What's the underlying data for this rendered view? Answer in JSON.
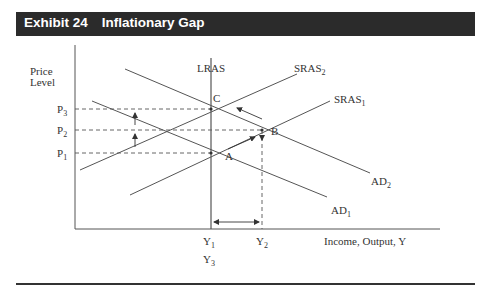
{
  "header": {
    "exhibit": "Exhibit 24",
    "title": "Inflationary Gap"
  },
  "axes": {
    "y_label_line1": "Price",
    "y_label_line2": "Level",
    "x_label": "Income, Output, Y"
  },
  "price_levels": [
    {
      "base": "P",
      "sub": "3"
    },
    {
      "base": "P",
      "sub": "2"
    },
    {
      "base": "P",
      "sub": "1"
    }
  ],
  "output_levels": [
    {
      "base": "Y",
      "sub": "1"
    },
    {
      "base": "Y",
      "sub": "2"
    },
    {
      "base": "Y",
      "sub": "3"
    }
  ],
  "curves": {
    "lras": "LRAS",
    "sras2": {
      "base": "SRAS",
      "sub": "2"
    },
    "sras1": {
      "base": "SRAS",
      "sub": "1"
    },
    "ad2": {
      "base": "AD",
      "sub": "2"
    },
    "ad1": {
      "base": "AD",
      "sub": "1"
    }
  },
  "points": {
    "a": "A",
    "b": "B",
    "c": "C"
  },
  "colors": {
    "header_bg": "#2b2b2b",
    "line": "#555555",
    "text": "#333333"
  }
}
